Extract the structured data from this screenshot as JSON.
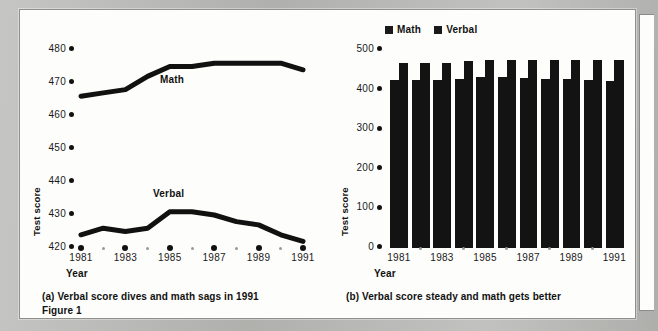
{
  "figure": {
    "number_label": "Figure 1",
    "axis_title_x": "Year",
    "axis_title_y": "Test score"
  },
  "panel_a": {
    "caption": "(a) Verbal score dives and math sags in 1991",
    "series_label_math": "Math",
    "series_label_verbal": "Verbal"
  },
  "panel_b": {
    "caption": "(b) Verbal score steady and math gets better",
    "legend": [
      {
        "label": "Math",
        "color": "#1a1a1a"
      },
      {
        "label": "Verbal",
        "color": "#1a1a1a"
      }
    ]
  },
  "colors": {
    "ink": "#111111",
    "paper": "#fdfdfb",
    "scan_background": "#b9b9b6",
    "bar_fill": "#131313",
    "minor_tick": "#9a9a9a"
  },
  "chart_data": [
    {
      "id": "panel-a-line",
      "type": "line",
      "title": "(a) Verbal score dives and math sags in 1991",
      "xlabel": "Year",
      "ylabel": "Test score",
      "ylim": [
        420,
        480
      ],
      "yticks": [
        420,
        430,
        440,
        450,
        460,
        470,
        480
      ],
      "grid": false,
      "legend": "inline-labels",
      "x": [
        1981,
        1982,
        1983,
        1984,
        1985,
        1986,
        1987,
        1988,
        1989,
        1990,
        1991
      ],
      "xtick_labels": [
        "1981",
        "",
        "1983",
        "",
        "1985",
        "",
        "1987",
        "",
        "1989",
        "",
        "1991"
      ],
      "series": [
        {
          "name": "Math",
          "values": [
            466,
            467,
            468,
            472,
            475,
            475,
            476,
            476,
            476,
            476,
            474
          ]
        },
        {
          "name": "Verbal",
          "values": [
            424,
            426,
            425,
            426,
            431,
            431,
            430,
            428,
            427,
            424,
            422
          ]
        }
      ]
    },
    {
      "id": "panel-b-bars",
      "type": "bar",
      "title": "(b) Verbal score steady and math gets better",
      "xlabel": "Year",
      "ylabel": "Test score",
      "ylim": [
        0,
        500
      ],
      "yticks": [
        0,
        100,
        200,
        300,
        400,
        500
      ],
      "grid": false,
      "legend_position": "top",
      "categories": [
        "1981",
        "1982",
        "1983",
        "1984",
        "1985",
        "1986",
        "1987",
        "1988",
        "1989",
        "1990",
        "1991"
      ],
      "xtick_labels": [
        "1981",
        "",
        "1983",
        "",
        "1985",
        "",
        "1987",
        "",
        "1989",
        "",
        "1991"
      ],
      "series": [
        {
          "name": "Math",
          "values": [
            424,
            425,
            425,
            426,
            431,
            431,
            430,
            428,
            427,
            425,
            422
          ]
        },
        {
          "name": "Verbal",
          "values": [
            466,
            467,
            468,
            472,
            475,
            475,
            476,
            476,
            476,
            476,
            474
          ]
        }
      ]
    }
  ]
}
